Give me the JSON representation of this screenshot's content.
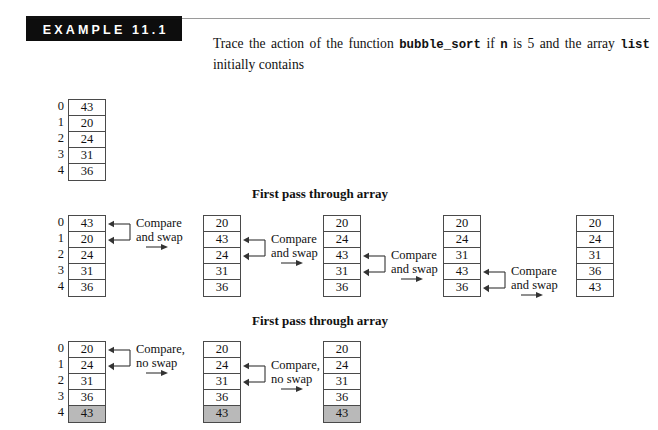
{
  "header": {
    "badge_label": "EXAMPLE 11.1",
    "body_prefix": "Trace the action of the function ",
    "body_fn": "bubble_sort",
    "body_mid1": " if ",
    "body_var_n": "n",
    "body_mid2": " is 5 and the array ",
    "body_var_list": "list",
    "body_suffix": " initially contains"
  },
  "colors": {
    "badge_background": "#0d0d0d",
    "badge_text": "#ffffff",
    "shaded_cell": "#b9b9b9",
    "box_border": "#4a4a4a",
    "page_background": "#ffffff",
    "text": "#111111"
  },
  "indices": [
    "0",
    "1",
    "2",
    "3",
    "4"
  ],
  "initial_array": {
    "values": [
      "43",
      "20",
      "24",
      "31",
      "36"
    ],
    "shaded": [
      false,
      false,
      false,
      false,
      false
    ],
    "show_indices": true
  },
  "pass1": {
    "heading": "First pass through array",
    "steps": [
      {
        "values": [
          "43",
          "20",
          "24",
          "31",
          "36"
        ],
        "shaded": [
          false,
          false,
          false,
          false,
          false
        ],
        "show_indices": true,
        "annotation": {
          "line1": "Compare",
          "line2": "and swap",
          "compare_rows": [
            0,
            1
          ]
        }
      },
      {
        "values": [
          "20",
          "43",
          "24",
          "31",
          "36"
        ],
        "shaded": [
          false,
          false,
          false,
          false,
          false
        ],
        "show_indices": false,
        "annotation": {
          "line1": "Compare",
          "line2": "and swap",
          "compare_rows": [
            1,
            2
          ]
        }
      },
      {
        "values": [
          "20",
          "24",
          "43",
          "31",
          "36"
        ],
        "shaded": [
          false,
          false,
          false,
          false,
          false
        ],
        "show_indices": false,
        "annotation": {
          "line1": "Compare",
          "line2": "and swap",
          "compare_rows": [
            2,
            3
          ]
        }
      },
      {
        "values": [
          "20",
          "24",
          "31",
          "43",
          "36"
        ],
        "shaded": [
          false,
          false,
          false,
          false,
          false
        ],
        "show_indices": false,
        "annotation": {
          "line1": "Compare",
          "line2": "and swap",
          "compare_rows": [
            3,
            4
          ]
        }
      },
      {
        "values": [
          "20",
          "24",
          "31",
          "36",
          "43"
        ],
        "shaded": [
          false,
          false,
          false,
          false,
          false
        ],
        "show_indices": false,
        "annotation": null
      }
    ]
  },
  "pass2": {
    "heading": "First pass through array",
    "steps": [
      {
        "values": [
          "20",
          "24",
          "31",
          "36",
          "43"
        ],
        "shaded": [
          false,
          false,
          false,
          false,
          true
        ],
        "show_indices": true,
        "annotation": {
          "line1": "Compare,",
          "line2": "no swap",
          "compare_rows": [
            0,
            1
          ]
        }
      },
      {
        "values": [
          "20",
          "24",
          "31",
          "36",
          "43"
        ],
        "shaded": [
          false,
          false,
          false,
          false,
          true
        ],
        "show_indices": false,
        "annotation": {
          "line1": "Compare,",
          "line2": "no swap",
          "compare_rows": [
            1,
            2
          ]
        }
      },
      {
        "values": [
          "20",
          "24",
          "31",
          "36",
          "43"
        ],
        "shaded": [
          false,
          false,
          false,
          false,
          true
        ],
        "show_indices": false,
        "annotation": null
      }
    ]
  },
  "layout": {
    "initial_array_pos": {
      "left": 68,
      "top": 99
    },
    "pass1_heading_pos": {
      "left": 252,
      "top": 186
    },
    "pass1_top": 215,
    "pass2_heading_pos": {
      "left": 252,
      "top": 313
    },
    "pass2_top": 341,
    "column_lefts": [
      68,
      203,
      323,
      443,
      576
    ],
    "cell_height": 16
  }
}
